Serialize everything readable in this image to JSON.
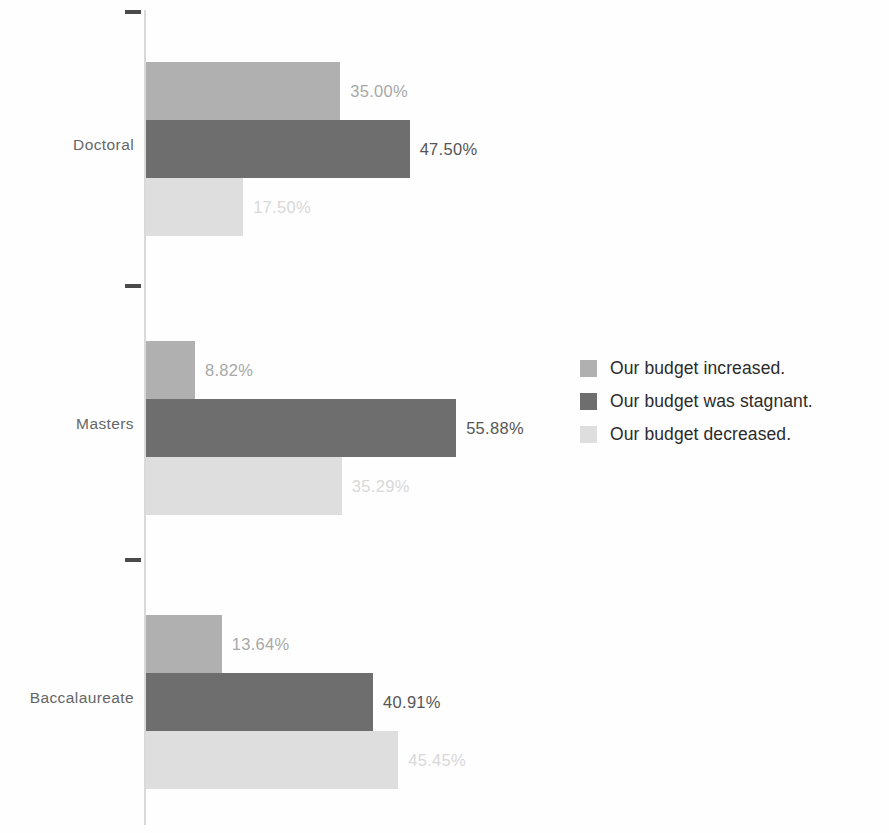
{
  "chart_data": {
    "type": "bar",
    "orientation": "horizontal",
    "grouped": true,
    "title": "",
    "subtitle": "",
    "xlabel": "",
    "ylabel": "",
    "grid": false,
    "axis": {
      "category_axis": "y",
      "value_axis": "x",
      "value_axis_visible": false,
      "xlim": [
        0,
        60
      ],
      "tick_labels": []
    },
    "categories": [
      "Doctoral",
      "Masters",
      "Baccalaureate"
    ],
    "series": [
      {
        "name": "Our budget increased.",
        "color": "#b0b0b0",
        "values": [
          35.0,
          8.82,
          13.64
        ],
        "labels": [
          "35.00%",
          "8.82%",
          "13.64%"
        ],
        "label_color": "#a8a8a8"
      },
      {
        "name": "Our budget was stagnant.",
        "color": "#6e6e6e",
        "values": [
          47.5,
          55.88,
          40.91
        ],
        "labels": [
          "47.50%",
          "55.88%",
          "40.91%"
        ],
        "label_color": "#555555"
      },
      {
        "name": "Our budget decreased.",
        "color": "#dedede",
        "values": [
          17.5,
          35.29,
          45.45
        ],
        "labels": [
          "17.50%",
          "35.29%",
          "45.45%"
        ],
        "label_color": "#d8d8d8"
      }
    ],
    "legend": {
      "position": "right",
      "entries": [
        {
          "label": "Our budget increased.",
          "color": "#b0b0b0"
        },
        {
          "label": "Our budget was stagnant.",
          "color": "#6e6e6e"
        },
        {
          "label": "Our budget decreased.",
          "color": "#dedede"
        }
      ]
    }
  }
}
